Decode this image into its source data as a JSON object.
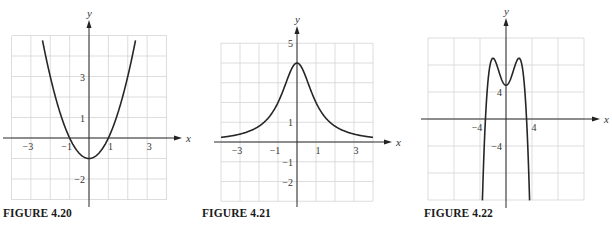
{
  "figures": [
    {
      "caption": "FIGURE 4.20"
    },
    {
      "caption": "FIGURE 4.21"
    },
    {
      "caption": "FIGURE 4.22"
    }
  ],
  "chart_data": [
    {
      "type": "line",
      "title": "FIGURE 4.20",
      "xlabel": "x",
      "ylabel": "y",
      "function": "x^2 - 1",
      "xlim": [
        -4,
        4
      ],
      "ylim": [
        -3,
        5
      ],
      "grid": true,
      "grid_step": 1,
      "x_ticks": [
        -3,
        -1,
        1,
        3
      ],
      "y_ticks": [
        3,
        1,
        -2
      ],
      "series": [
        {
          "name": "f",
          "x": [
            -2.4,
            -2,
            -1,
            0,
            1,
            2,
            2.4
          ],
          "y": [
            4.76,
            3,
            0,
            -1,
            0,
            3,
            4.76
          ]
        }
      ]
    },
    {
      "type": "line",
      "title": "FIGURE 4.21",
      "xlabel": "x",
      "ylabel": "y",
      "function": "4 / (1 + x^2)",
      "xlim": [
        -4,
        4
      ],
      "ylim": [
        -3,
        5
      ],
      "grid": true,
      "grid_step": 1,
      "x_ticks": [
        -3,
        -1,
        1,
        3
      ],
      "y_ticks": [
        5,
        1,
        -1,
        -2
      ],
      "series": [
        {
          "name": "f",
          "x": [
            -4,
            -3,
            -2,
            -1,
            0,
            1,
            2,
            3,
            4
          ],
          "y": [
            0.24,
            0.4,
            0.8,
            2,
            4,
            2,
            0.8,
            0.4,
            0.24
          ]
        }
      ]
    },
    {
      "type": "line",
      "title": "FIGURE 4.22",
      "xlabel": "x",
      "ylabel": "y",
      "function": "-x^4/4 + 2x^2 + 5",
      "xlim": [
        -12,
        12
      ],
      "ylim": [
        -12,
        12
      ],
      "grid": true,
      "grid_step": 4,
      "x_ticks": [
        -4,
        4
      ],
      "y_ticks": [
        4,
        -4
      ],
      "series": [
        {
          "name": "f",
          "x": [
            -3.63,
            -3.16,
            -2,
            0,
            2,
            3.16,
            3.63
          ],
          "y": [
            -12,
            0,
            9,
            5,
            9,
            0,
            -12
          ]
        }
      ]
    }
  ],
  "layout": [
    {
      "left": 12,
      "right": 167,
      "top": 36,
      "bottom": 200,
      "ox": 89,
      "oy": 138,
      "axisTop": 20,
      "axisBottom": 207,
      "axisLeft": 3,
      "axisRight": 182,
      "captionX": 3
    },
    {
      "left": 221,
      "right": 373,
      "top": 43,
      "bottom": 201,
      "ox": 297,
      "oy": 142,
      "axisTop": 26,
      "axisBottom": 207,
      "axisLeft": 214,
      "axisRight": 392,
      "captionX": 202
    },
    {
      "left": 428,
      "right": 584,
      "top": 38,
      "bottom": 200,
      "ox": 506,
      "oy": 119,
      "axisTop": 18,
      "axisBottom": 208,
      "axisLeft": 421,
      "axisRight": 600,
      "captionX": 424
    }
  ]
}
